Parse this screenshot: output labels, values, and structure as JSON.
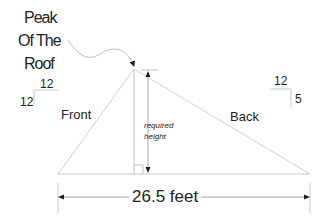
{
  "title": {
    "lines": [
      "Peak",
      "Of The",
      "Roof"
    ]
  },
  "labels": {
    "front": "Front",
    "back": "Back",
    "required_height_line1": "required",
    "required_height_line2": "height"
  },
  "pitch_front": {
    "run": "12",
    "rise": "12"
  },
  "pitch_back": {
    "run": "12",
    "rise": "5"
  },
  "dimension": {
    "span": "26.5 feet"
  },
  "colors": {
    "line": "#c8c8c8",
    "dark_line": "#555555",
    "text": "#222222"
  }
}
